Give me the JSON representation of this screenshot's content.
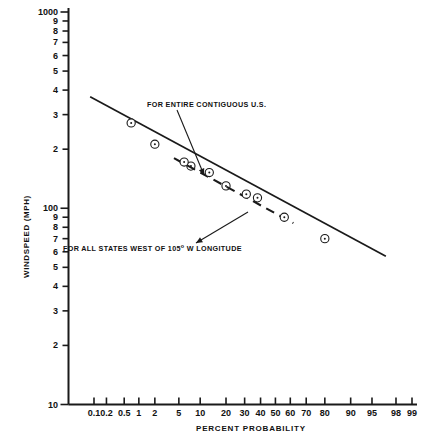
{
  "chart_data": {
    "type": "line",
    "title": "",
    "xlabel": "PERCENT PROBABILITY",
    "ylabel": "WINDSPEED (MPH)",
    "x_scale": "probability",
    "y_scale": "log",
    "ylim": [
      10,
      1000
    ],
    "grid": false,
    "legend_position": "inline-annotations",
    "x_ticks": [
      {
        "value": 0.1,
        "label": "0.1"
      },
      {
        "value": 0.2,
        "label": "0.2"
      },
      {
        "value": 0.5,
        "label": "0.5"
      },
      {
        "value": 1,
        "label": "1"
      },
      {
        "value": 2,
        "label": "2"
      },
      {
        "value": 5,
        "label": "5"
      },
      {
        "value": 10,
        "label": "10"
      },
      {
        "value": 20,
        "label": "20"
      },
      {
        "value": 30,
        "label": "30"
      },
      {
        "value": 40,
        "label": "40"
      },
      {
        "value": 50,
        "label": "50"
      },
      {
        "value": 60,
        "label": "60"
      },
      {
        "value": 70,
        "label": "70"
      },
      {
        "value": 80,
        "label": "80"
      },
      {
        "value": 90,
        "label": "90"
      },
      {
        "value": 95,
        "label": "95"
      },
      {
        "value": 98,
        "label": "98"
      },
      {
        "value": 99,
        "label": "99"
      }
    ],
    "y_ticks": [
      {
        "value": 1000,
        "label": "1000"
      },
      {
        "value": 900,
        "label": "9"
      },
      {
        "value": 800,
        "label": "8"
      },
      {
        "value": 700,
        "label": "7"
      },
      {
        "value": 600,
        "label": "6"
      },
      {
        "value": 500,
        "label": "5"
      },
      {
        "value": 400,
        "label": "4"
      },
      {
        "value": 300,
        "label": "3"
      },
      {
        "value": 200,
        "label": "2"
      },
      {
        "value": 100,
        "label": "100"
      },
      {
        "value": 90,
        "label": "9"
      },
      {
        "value": 80,
        "label": "8"
      },
      {
        "value": 70,
        "label": "7"
      },
      {
        "value": 60,
        "label": "6"
      },
      {
        "value": 50,
        "label": "5"
      },
      {
        "value": 40,
        "label": "4"
      },
      {
        "value": 30,
        "label": "3"
      },
      {
        "value": 20,
        "label": "2"
      },
      {
        "value": 10,
        "label": "10"
      }
    ],
    "series": [
      {
        "name": "FOR ENTIRE CONTIGUOUS U.S.",
        "style": "solid",
        "marker": "circle-dot",
        "line_endpoints": [
          {
            "x_pct": 0.08,
            "windspeed": 370
          },
          {
            "x_pct": 97.0,
            "windspeed": 57
          }
        ],
        "points": [
          {
            "x_pct": 0.7,
            "windspeed": 272
          },
          {
            "x_pct": 2.0,
            "windspeed": 212
          },
          {
            "x_pct": 7.5,
            "windspeed": 164
          },
          {
            "x_pct": 20.0,
            "windspeed": 130
          },
          {
            "x_pct": 38.0,
            "windspeed": 113
          },
          {
            "x_pct": 80.0,
            "windspeed": 70
          }
        ]
      },
      {
        "name": "FOR ALL STATES WEST OF 105° W LONGITUDE",
        "style": "dashed",
        "marker": "circle-dot",
        "line_endpoints": [
          {
            "x_pct": 4.2,
            "windspeed": 180
          },
          {
            "x_pct": 62.0,
            "windspeed": 84
          }
        ],
        "points": [
          {
            "x_pct": 6.0,
            "windspeed": 172
          },
          {
            "x_pct": 13.0,
            "windspeed": 152
          },
          {
            "x_pct": 31.0,
            "windspeed": 118
          },
          {
            "x_pct": 56.0,
            "windspeed": 90
          }
        ]
      }
    ],
    "annotations": [
      {
        "id": "annotation-contiguous",
        "text": "FOR ENTIRE CONTIGUOUS  U.S.",
        "leader_from": {
          "x": 177,
          "y": 110
        },
        "leader_to": {
          "x": 204,
          "y": 175
        }
      },
      {
        "id": "annotation-west",
        "text": "FOR ALL STATES WEST OF 105° W LONGITUDE",
        "text_html": "FOR ALL STATES WEST OF 105<sup>o</sup> W LONGITUDE",
        "leader_from": {
          "x": 248,
          "y": 212
        },
        "leader_to": {
          "x": 196,
          "y": 243
        }
      }
    ]
  },
  "axes": {
    "x_axis_label": "PERCENT PROBABILITY",
    "y_axis_label": "WINDSPEED (MPH)"
  }
}
